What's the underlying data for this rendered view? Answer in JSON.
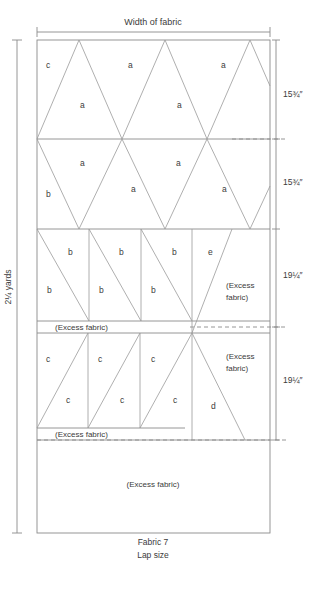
{
  "diagram": {
    "title": "Width of fabric",
    "caption_line1": "Fabric 7",
    "caption_line2": "Lap size",
    "height_label": "2¼ yards",
    "row_measurements": [
      {
        "id": "row1",
        "label": "15¾″"
      },
      {
        "id": "row2",
        "label": "15¾″"
      },
      {
        "id": "row3",
        "label": "19¼″"
      },
      {
        "id": "row4",
        "label": "19¼″"
      }
    ],
    "excess_labels": {
      "mid_strip": "(Excess fabric)",
      "lower_strip": "(Excess fabric)",
      "right_upper_line1": "(Excess",
      "right_upper_line2": "fabric)",
      "right_lower_line1": "(Excess",
      "right_lower_line2": "fabric)",
      "bottom_block": "(Excess fabric)"
    },
    "pieces": {
      "row1": [
        {
          "name": "p-r1-c",
          "label": "c",
          "x": 46,
          "y": 68
        },
        {
          "name": "p-r1-a1",
          "label": "a",
          "x": 80,
          "y": 108
        },
        {
          "name": "p-r1-a2",
          "label": "a",
          "x": 128,
          "y": 68
        },
        {
          "name": "p-r1-a3",
          "label": "a",
          "x": 177,
          "y": 108
        },
        {
          "name": "p-r1-a4",
          "label": "a",
          "x": 221,
          "y": 68
        }
      ],
      "row2": [
        {
          "name": "p-r2-b",
          "label": "b",
          "x": 46,
          "y": 197
        },
        {
          "name": "p-r2-a1",
          "label": "a",
          "x": 80,
          "y": 166
        },
        {
          "name": "p-r2-a2",
          "label": "a",
          "x": 131,
          "y": 192
        },
        {
          "name": "p-r2-a3",
          "label": "a",
          "x": 176,
          "y": 166
        },
        {
          "name": "p-r2-a4",
          "label": "a",
          "x": 222,
          "y": 192
        }
      ],
      "row3": [
        {
          "name": "p-r3-b1",
          "label": "b",
          "x": 68,
          "y": 255
        },
        {
          "name": "p-r3-b2",
          "label": "b",
          "x": 47,
          "y": 293
        },
        {
          "name": "p-r3-b3",
          "label": "b",
          "x": 119,
          "y": 255
        },
        {
          "name": "p-r3-b4",
          "label": "b",
          "x": 99,
          "y": 293
        },
        {
          "name": "p-r3-b5",
          "label": "b",
          "x": 172,
          "y": 255
        },
        {
          "name": "p-r3-b6",
          "label": "b",
          "x": 151,
          "y": 293
        },
        {
          "name": "p-r3-e",
          "label": "e",
          "x": 208,
          "y": 255
        }
      ],
      "row4": [
        {
          "name": "p-r4-c1",
          "label": "c",
          "x": 46,
          "y": 362
        },
        {
          "name": "p-r4-c2",
          "label": "c",
          "x": 66,
          "y": 403
        },
        {
          "name": "p-r4-c3",
          "label": "c",
          "x": 98,
          "y": 362
        },
        {
          "name": "p-r4-c4",
          "label": "c",
          "x": 120,
          "y": 403
        },
        {
          "name": "p-r4-c5",
          "label": "c",
          "x": 151,
          "y": 362
        },
        {
          "name": "p-r4-c6",
          "label": "c",
          "x": 173,
          "y": 403
        },
        {
          "name": "p-r4-d",
          "label": "d",
          "x": 211,
          "y": 409
        }
      ]
    }
  }
}
